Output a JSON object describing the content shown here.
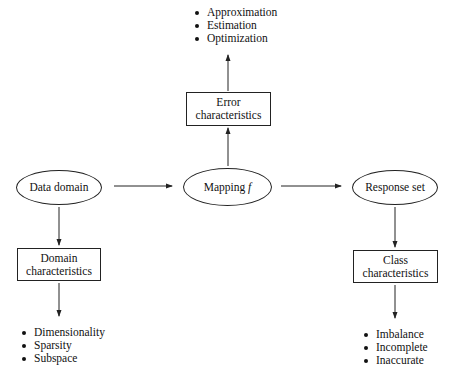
{
  "diagram": {
    "nodes": {
      "data_domain": {
        "label": "Data domain",
        "shape": "ellipse"
      },
      "mapping": {
        "label": "Mapping",
        "symbol": "f",
        "shape": "ellipse"
      },
      "response_set": {
        "label": "Response set",
        "shape": "ellipse"
      },
      "error_characteristics": {
        "line1": "Error",
        "line2": "characteristics",
        "shape": "box"
      },
      "domain_characteristics": {
        "line1": "Domain",
        "line2": "characteristics",
        "shape": "box"
      },
      "class_characteristics": {
        "line1": "Class",
        "line2": "characteristics",
        "shape": "box"
      }
    },
    "lists": {
      "error": [
        "Approximation",
        "Estimation",
        "Optimization"
      ],
      "domain": [
        "Dimensionality",
        "Sparsity",
        "Subspace"
      ],
      "class": [
        "Imbalance",
        "Incomplete",
        "Inaccurate"
      ]
    },
    "edges": [
      {
        "from": "data_domain",
        "to": "mapping"
      },
      {
        "from": "mapping",
        "to": "response_set"
      },
      {
        "from": "mapping",
        "to": "error_characteristics"
      },
      {
        "from": "error_characteristics",
        "to": "error_list"
      },
      {
        "from": "data_domain",
        "to": "domain_characteristics"
      },
      {
        "from": "domain_characteristics",
        "to": "domain_list"
      },
      {
        "from": "response_set",
        "to": "class_characteristics"
      },
      {
        "from": "class_characteristics",
        "to": "class_list"
      }
    ],
    "colors": {
      "stroke": "#222222",
      "text": "#111111",
      "background": "#ffffff"
    }
  }
}
